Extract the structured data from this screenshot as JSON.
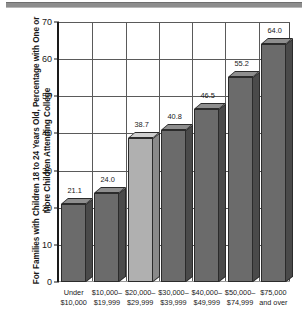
{
  "chart_data": {
    "type": "bar",
    "title": "",
    "xlabel": "",
    "ylabel": "For Families with Children 18 to 24 Years Old, Percentage with One or More Children Attending College",
    "categories": [
      "Under\n$10,000",
      "$10,000–\n$19,999",
      "$20,000–\n$29,999",
      "$30,000–\n$39,999",
      "$40,000–\n$49,999",
      "$50,000–\n$74,999",
      "$75,000\nand over"
    ],
    "category_lines": [
      [
        "Under",
        "$10,000"
      ],
      [
        "$10,000–",
        "$19,999"
      ],
      [
        "$20,000–",
        "$29,999"
      ],
      [
        "$30,000–",
        "$39,999"
      ],
      [
        "$40,000–",
        "$49,999"
      ],
      [
        "$50,000–",
        "$74,999"
      ],
      [
        "$75,000",
        "and over"
      ]
    ],
    "values": [
      21.1,
      24.0,
      38.7,
      40.8,
      46.5,
      55.2,
      64.0
    ],
    "value_labels": [
      "21.1",
      "24.0",
      "38.7",
      "40.8",
      "46.5",
      "55.2",
      "64.0"
    ],
    "highlighted_index": 2,
    "ylim": [
      0,
      70
    ],
    "yticks": [
      0,
      10,
      20,
      30,
      40,
      50,
      60,
      70
    ],
    "ytick_labels": [
      "0",
      "10",
      "20",
      "30",
      "40",
      "50",
      "60",
      "70"
    ],
    "grid": {
      "horizontal": true,
      "vertical": true
    },
    "legend": null,
    "colors": {
      "bar_front": "#6b6b6b",
      "bar_side": "#4a4a4a",
      "bar_top": "#8e8e8e",
      "bar_front_highlight": "#b0b0b0",
      "bar_side_highlight": "#8a8a8a",
      "bar_top_highlight": "#cfcfcf",
      "axis": "#1a1a1a",
      "grid": "#5a5a5a",
      "top_rule": "#8d8d8d",
      "text": "#1a1a1a",
      "background": "#ffffff"
    }
  }
}
